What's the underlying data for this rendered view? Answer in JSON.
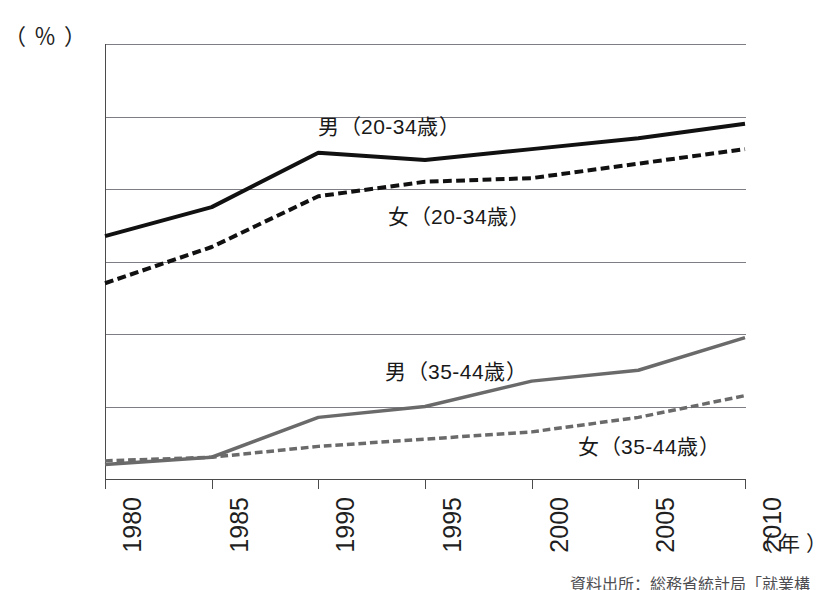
{
  "figure": {
    "title_partial": "",
    "unit_label": "（ ％ ）",
    "xaxis_unit": "（ 年 ）",
    "source_note_partial": "資料出所：総務省統計局「就業構"
  },
  "chart_data": {
    "type": "line",
    "title": "",
    "xlabel": "（ 年 ）",
    "ylabel": "（ ％ ）",
    "x": [
      1980,
      1985,
      1990,
      1995,
      2000,
      2005,
      2010
    ],
    "categories": [
      "1980",
      "1985",
      "1990",
      "1995",
      "2000",
      "2005",
      "2010"
    ],
    "xlim": [
      1980,
      2010
    ],
    "ylim": [
      0,
      60
    ],
    "yticks": [
      0,
      10,
      20,
      30,
      40,
      50,
      60
    ],
    "ytick_labels": [
      "0",
      "10",
      "20",
      "30",
      "40",
      "50",
      "60"
    ],
    "grid": true,
    "legend_position": "inline-annotations",
    "series": [
      {
        "name": "男（20-34歳）",
        "style": "solid",
        "color": "#111111",
        "width": 4,
        "values": [
          33.5,
          37.5,
          45.0,
          44.0,
          45.5,
          47.0,
          49.0
        ]
      },
      {
        "name": "女（20-34歳）",
        "style": "dashed",
        "color": "#111111",
        "width": 4,
        "values": [
          27.0,
          32.0,
          39.0,
          41.0,
          41.5,
          43.5,
          45.5
        ]
      },
      {
        "name": "男（35-44歳）",
        "style": "solid",
        "color": "#6a6a6a",
        "width": 3.5,
        "values": [
          2.0,
          3.0,
          8.5,
          10.0,
          13.5,
          15.0,
          19.5
        ]
      },
      {
        "name": "女（35-44歳）",
        "style": "dashed",
        "color": "#6a6a6a",
        "width": 3.5,
        "values": [
          2.5,
          3.0,
          4.5,
          5.5,
          6.5,
          8.5,
          11.5
        ]
      }
    ]
  },
  "annotations": [
    {
      "text": "男（20-34歳）"
    },
    {
      "text": "女（20-34歳）"
    },
    {
      "text": "男（35-44歳）"
    },
    {
      "text": "女（35-44歳）"
    }
  ]
}
